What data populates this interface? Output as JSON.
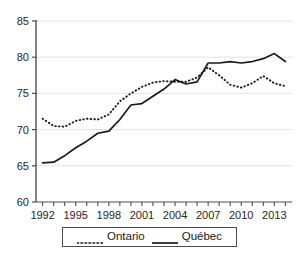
{
  "chart_data": {
    "type": "line",
    "title": "",
    "subtitle": "",
    "xlabel": "",
    "ylabel": "",
    "xlim": [
      1991.4,
      2014.6
    ],
    "ylim": [
      60,
      85
    ],
    "yticks": [
      60,
      65,
      70,
      75,
      80,
      85
    ],
    "ytick_labels": [
      "60",
      "65",
      "70",
      "75",
      "80",
      "85"
    ],
    "grid": "horizontal",
    "legend_position": "bottom-center",
    "x": [
      1992,
      1993,
      1994,
      1995,
      1996,
      1997,
      1998,
      1999,
      2000,
      2001,
      2002,
      2003,
      2004,
      2005,
      2006,
      2007,
      2008,
      2009,
      2010,
      2011,
      2012,
      2013,
      2014
    ],
    "xtick_labels": [
      "1992",
      "",
      "",
      "1995",
      "",
      "",
      "1998",
      "",
      "",
      "2001",
      "",
      "",
      "2004",
      "",
      "",
      "2007",
      "",
      "",
      "2010",
      "",
      "",
      "2013",
      ""
    ],
    "xticks_all": [
      1992,
      1993,
      1994,
      1995,
      1996,
      1997,
      1998,
      1999,
      2000,
      2001,
      2002,
      2003,
      2004,
      2005,
      2006,
      2007,
      2008,
      2009,
      2010,
      2011,
      2012,
      2013,
      2014
    ],
    "xticks_labeled": [
      1992,
      1995,
      1998,
      2001,
      2004,
      2007,
      2010,
      2013
    ],
    "series": [
      {
        "name": "Ontario",
        "style": "dotted",
        "color": "#1a1a1a",
        "values": [
          71.5,
          70.5,
          70.4,
          71.2,
          71.5,
          71.4,
          72.1,
          73.9,
          75.0,
          75.9,
          76.5,
          76.7,
          76.6,
          76.6,
          77.2,
          76.8,
          76.6,
          77.2,
          78.6,
          77.9,
          76.6,
          75.8,
          76.2
        ]
      },
      {
        "name": "Québec",
        "style": "solid",
        "color": "#1a1a1a",
        "values": [
          65.4,
          65.5,
          66.4,
          67.5,
          68.4,
          69.5,
          69.8,
          71.4,
          73.4,
          73.6,
          74.6,
          74.8,
          75.6,
          76.3,
          76.6,
          76.3,
          76.7,
          77.0,
          79.2,
          79.2,
          79.3,
          79.4,
          79.2
        ]
      }
    ],
    "series_ontario_full": {
      "1992": 71.5,
      "1993": 70.5,
      "1994": 70.4,
      "1995": 71.2,
      "1996": 71.5,
      "1997": 71.4,
      "1998": 72.1,
      "1999": 73.9,
      "2000": 75.0,
      "2001": 75.9,
      "2002": 76.5,
      "2003": 76.7,
      "2004": 76.6,
      "2005": 76.6,
      "2006": 77.2,
      "2007": 78.6,
      "2008": 77.5,
      "2009": 76.2,
      "2010": 75.8,
      "2011": 76.4,
      "2012": 77.4,
      "2013": 76.4,
      "2014": 76.0
    },
    "series_quebec_full": {
      "1992": 65.4,
      "1993": 65.5,
      "1994": 66.4,
      "1995": 67.5,
      "1996": 68.4,
      "1997": 69.5,
      "1998": 69.8,
      "1999": 71.4,
      "2000": 73.4,
      "2001": 73.6,
      "2002": 74.6,
      "2003": 75.6,
      "2004": 76.9,
      "2005": 76.3,
      "2006": 76.6,
      "2007": 79.2,
      "2008": 79.2,
      "2009": 79.4,
      "2010": 79.2,
      "2011": 79.4,
      "2012": 79.8,
      "2013": 80.5,
      "2014": 79.4
    }
  },
  "legend": {
    "entries": [
      {
        "label": "Ontario",
        "style": "dotted"
      },
      {
        "label": "Québec",
        "style": "solid"
      }
    ]
  }
}
